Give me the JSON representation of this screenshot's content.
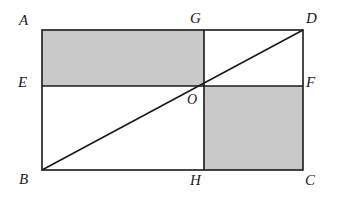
{
  "figure": {
    "kind": "geometry-diagram",
    "canvas": {
      "width": 342,
      "height": 205,
      "background": "#ffffff"
    },
    "style": {
      "stroke_color": "#1a1a1a",
      "stroke_width": 1.6,
      "shade_color": "#c9c9c9",
      "shade_opacity": 1,
      "label_color": "#1a1a1a"
    },
    "rectangle": {
      "name": "ABCD",
      "left": 42,
      "right": 303,
      "top": 30,
      "bottom": 170
    },
    "lines": {
      "EF": {
        "name": "EF",
        "y": 86,
        "x1": 42,
        "x2": 303
      },
      "GH": {
        "name": "GH",
        "x": 204,
        "y1": 30,
        "y2": 170
      },
      "BD": {
        "name": "BD",
        "x1": 42,
        "y1": 170,
        "x2": 303,
        "y2": 30
      }
    },
    "points": [
      {
        "id": "A",
        "label": "A",
        "x": 42,
        "y": 30,
        "label_x": 19,
        "label_y": 13
      },
      {
        "id": "G",
        "label": "G",
        "x": 204,
        "y": 30,
        "label_x": 190,
        "label_y": 11
      },
      {
        "id": "D",
        "label": "D",
        "x": 303,
        "y": 30,
        "label_x": 306,
        "label_y": 11
      },
      {
        "id": "E",
        "label": "E",
        "x": 42,
        "y": 86,
        "label_x": 18,
        "label_y": 75
      },
      {
        "id": "O",
        "label": "O",
        "x": 204,
        "y": 86,
        "label_x": 187,
        "label_y": 92
      },
      {
        "id": "F",
        "label": "F",
        "x": 303,
        "y": 86,
        "label_x": 306,
        "label_y": 75
      },
      {
        "id": "B",
        "label": "B",
        "x": 42,
        "y": 170,
        "label_x": 19,
        "label_y": 172
      },
      {
        "id": "H",
        "label": "H",
        "x": 204,
        "y": 170,
        "label_x": 190,
        "label_y": 173
      },
      {
        "id": "C",
        "label": "C",
        "x": 303,
        "y": 170,
        "label_x": 305,
        "label_y": 173
      }
    ],
    "shaded_regions": [
      {
        "id": "AEOG",
        "name": "upper-left-shaded-region",
        "x": 42,
        "y": 30,
        "width": 162,
        "height": 56
      },
      {
        "id": "OFCH",
        "name": "lower-right-shaded-region",
        "x": 204,
        "y": 86,
        "width": 99,
        "height": 84
      }
    ]
  }
}
